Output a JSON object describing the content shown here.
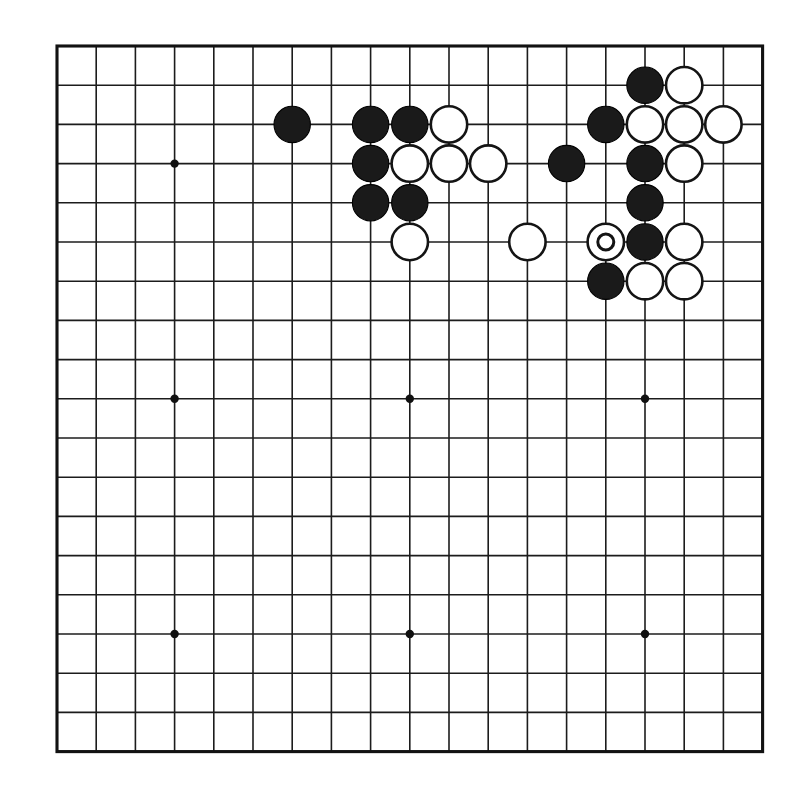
{
  "diagram": {
    "kind": "go-board-diagram",
    "board_size": 19,
    "background_color": "#ffffff",
    "line_color": "#1c1c1c",
    "black_color": "#1a1a1a",
    "white_color": "#ffffff",
    "geometry": {
      "origin_x": 57,
      "origin_y": 46,
      "spacing": 39.2,
      "stone_radius": 18.2,
      "mark_radius": 8.0
    },
    "star_points": [
      {
        "col": 3,
        "row": 3
      },
      {
        "col": 9,
        "row": 3
      },
      {
        "col": 15,
        "row": 3
      },
      {
        "col": 3,
        "row": 9
      },
      {
        "col": 9,
        "row": 9
      },
      {
        "col": 15,
        "row": 9
      },
      {
        "col": 3,
        "row": 15
      },
      {
        "col": 9,
        "row": 15
      },
      {
        "col": 15,
        "row": 15
      }
    ],
    "stones": [
      {
        "col": 6,
        "row": 2,
        "color": "black",
        "mark": "none"
      },
      {
        "col": 8,
        "row": 2,
        "color": "black",
        "mark": "none"
      },
      {
        "col": 9,
        "row": 2,
        "color": "black",
        "mark": "none"
      },
      {
        "col": 10,
        "row": 2,
        "color": "white",
        "mark": "none"
      },
      {
        "col": 15,
        "row": 1,
        "color": "black",
        "mark": "none"
      },
      {
        "col": 16,
        "row": 1,
        "color": "white",
        "mark": "none"
      },
      {
        "col": 14,
        "row": 2,
        "color": "black",
        "mark": "none"
      },
      {
        "col": 15,
        "row": 2,
        "color": "white",
        "mark": "none"
      },
      {
        "col": 16,
        "row": 2,
        "color": "white",
        "mark": "none"
      },
      {
        "col": 17,
        "row": 2,
        "color": "white",
        "mark": "none"
      },
      {
        "col": 8,
        "row": 3,
        "color": "black",
        "mark": "none"
      },
      {
        "col": 9,
        "row": 3,
        "color": "white",
        "mark": "none"
      },
      {
        "col": 10,
        "row": 3,
        "color": "white",
        "mark": "none"
      },
      {
        "col": 11,
        "row": 3,
        "color": "white",
        "mark": "none"
      },
      {
        "col": 13,
        "row": 3,
        "color": "black",
        "mark": "none"
      },
      {
        "col": 15,
        "row": 3,
        "color": "black",
        "mark": "none"
      },
      {
        "col": 16,
        "row": 3,
        "color": "white",
        "mark": "none"
      },
      {
        "col": 8,
        "row": 4,
        "color": "black",
        "mark": "none"
      },
      {
        "col": 9,
        "row": 4,
        "color": "black",
        "mark": "none"
      },
      {
        "col": 15,
        "row": 4,
        "color": "black",
        "mark": "none"
      },
      {
        "col": 9,
        "row": 5,
        "color": "white",
        "mark": "none"
      },
      {
        "col": 12,
        "row": 5,
        "color": "white",
        "mark": "none"
      },
      {
        "col": 14,
        "row": 5,
        "color": "white",
        "mark": "circle"
      },
      {
        "col": 15,
        "row": 5,
        "color": "black",
        "mark": "none"
      },
      {
        "col": 16,
        "row": 5,
        "color": "white",
        "mark": "none"
      },
      {
        "col": 14,
        "row": 6,
        "color": "black",
        "mark": "none"
      },
      {
        "col": 15,
        "row": 6,
        "color": "white",
        "mark": "none"
      },
      {
        "col": 16,
        "row": 6,
        "color": "white",
        "mark": "none"
      }
    ],
    "counts": {
      "black_stones": 14,
      "white_stones": 14,
      "marked_stones": 1
    }
  }
}
